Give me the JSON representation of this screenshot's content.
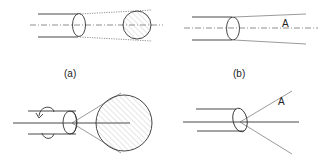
{
  "figure": {
    "panels": [
      {
        "id": "a",
        "caption": "(a)",
        "description": "Cylinder with ellipse cross-section projecting to a hatched circle along a dash-dot axis"
      },
      {
        "id": "b",
        "caption": "(b)",
        "description": "Cylinder with ellipse cross-section and diverging lines with label A along a dash-dot axis"
      },
      {
        "id": "c",
        "caption": "",
        "description": "Rotating cylinder (curved arrow) with cone expanding to a large hatched circle"
      },
      {
        "id": "d",
        "caption": "",
        "description": "Cylinder with ellipse end and three rays diverging from apex, label A"
      }
    ],
    "label_A_b": "A",
    "label_A_d": "A"
  }
}
